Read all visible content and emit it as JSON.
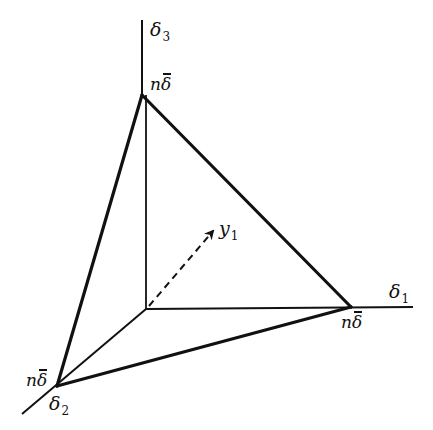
{
  "diagram": {
    "colors": {
      "background": "#ffffff",
      "ink": "#111111"
    },
    "axes": [
      {
        "id": "delta1",
        "symbol": "δ",
        "subscript": "1"
      },
      {
        "id": "delta2",
        "symbol": "δ",
        "subscript": "2"
      },
      {
        "id": "delta3",
        "symbol": "δ",
        "subscript": "3"
      }
    ],
    "vertices": [
      {
        "id": "v-delta3",
        "n": "n",
        "symbol": "δ",
        "label": "nδ̄"
      },
      {
        "id": "v-delta1",
        "n": "n",
        "symbol": "δ",
        "label": "nδ̄"
      },
      {
        "id": "v-delta2",
        "n": "n",
        "symbol": "δ",
        "label": "nδ̄"
      }
    ],
    "vector": {
      "symbol": "y",
      "subscript": "1",
      "style": "dashed-arrow"
    }
  }
}
